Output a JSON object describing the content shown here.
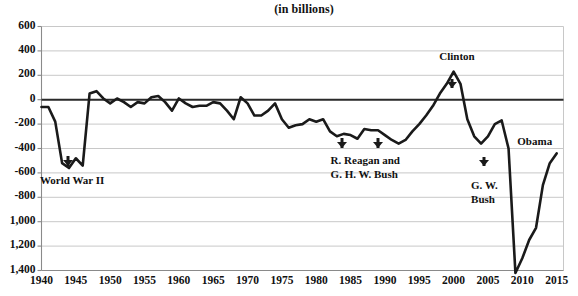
{
  "chart_data": {
    "type": "line",
    "title": "(in billions)",
    "subtitle": "",
    "xlabel": "",
    "ylabel": "",
    "xlim": [
      1940,
      2016
    ],
    "ylim": [
      -1400,
      600
    ],
    "grid": true,
    "legend": null,
    "zero_line": 0,
    "y_ticks": [
      600,
      400,
      200,
      0,
      -200,
      -400,
      -600,
      -800,
      -1000,
      -1200,
      -1400
    ],
    "y_tick_labels": [
      "600",
      "400",
      "200",
      "0",
      "-200",
      "-400",
      "-600",
      "-800",
      "1,000",
      "1,200",
      "1,400"
    ],
    "x_ticks": [
      1940,
      1945,
      1950,
      1955,
      1960,
      1965,
      1970,
      1975,
      1980,
      1985,
      1990,
      1995,
      2000,
      2005,
      2010,
      2015
    ],
    "x_tick_labels": [
      "1940",
      "1945",
      "1950",
      "1955",
      "1960",
      "1965",
      "1970",
      "1975",
      "1980",
      "1985",
      "1990",
      "1995",
      "2000",
      "2005",
      "2010",
      "2015"
    ],
    "series": [
      {
        "name": "Federal surplus or deficit",
        "color": "#1a1a1a",
        "x": [
          1940,
          1941,
          1942,
          1943,
          1944,
          1945,
          1946,
          1947,
          1948,
          1949,
          1950,
          1951,
          1952,
          1953,
          1954,
          1955,
          1956,
          1957,
          1958,
          1959,
          1960,
          1961,
          1962,
          1963,
          1964,
          1965,
          1966,
          1967,
          1968,
          1969,
          1970,
          1971,
          1972,
          1973,
          1974,
          1975,
          1976,
          1977,
          1978,
          1979,
          1980,
          1981,
          1982,
          1983,
          1984,
          1985,
          1986,
          1987,
          1988,
          1989,
          1990,
          1991,
          1992,
          1993,
          1994,
          1995,
          1996,
          1997,
          1998,
          1999,
          2000,
          2001,
          2002,
          2003,
          2004,
          2005,
          2006,
          2007,
          2008,
          2009,
          2010,
          2011,
          2012,
          2013,
          2014,
          2015
        ],
        "y": [
          -60,
          -60,
          -180,
          -520,
          -560,
          -480,
          -540,
          50,
          70,
          10,
          -30,
          10,
          -20,
          -60,
          -20,
          -30,
          20,
          30,
          -20,
          -90,
          10,
          -30,
          -60,
          -50,
          -50,
          -20,
          -30,
          -90,
          -160,
          20,
          -30,
          -130,
          -130,
          -90,
          -30,
          -160,
          -230,
          -210,
          -200,
          -160,
          -180,
          -160,
          -260,
          -300,
          -280,
          -290,
          -320,
          -240,
          -250,
          -250,
          -290,
          -330,
          -360,
          -330,
          -260,
          -200,
          -130,
          -50,
          50,
          130,
          230,
          130,
          -160,
          -300,
          -360,
          -300,
          -200,
          -170,
          -400,
          -1420,
          -1300,
          -1150,
          -1050,
          -700,
          -520,
          -440
        ]
      }
    ],
    "annotations": [
      {
        "id": "world-war-ii",
        "label": "World War II",
        "x_pct": 6.9,
        "y_pct": 58.8,
        "lines": [
          "World War II"
        ]
      },
      {
        "id": "reagan-bush",
        "label": "R. Reagan and G. H. W. Bush",
        "x_pct": 57.2,
        "y_pct": 52.0,
        "lines": [
          "R. Reagan and",
          "G. H. W. Bush"
        ]
      },
      {
        "id": "clinton",
        "label": "Clinton",
        "x_pct": 76.0,
        "y_pct": 17.0,
        "lines": [
          "Clinton"
        ]
      },
      {
        "id": "gw-bush",
        "label": "G. W. Bush",
        "x_pct": 81.5,
        "y_pct": 60.5,
        "lines": [
          "G. W.",
          "Bush"
        ]
      },
      {
        "id": "obama",
        "label": "Obama",
        "x_pct": 89.5,
        "y_pct": 45.5,
        "lines": [
          "Obama"
        ]
      }
    ]
  },
  "colors": {
    "line": "#1a1a1a",
    "grid": "#c8c8c8",
    "axis": "#8a8a8a",
    "zero_line": "#2a2a2a",
    "text": "#111111",
    "background": "#ffffff"
  }
}
